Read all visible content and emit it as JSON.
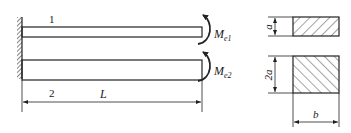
{
  "diagram": {
    "beam1": {
      "label": "1",
      "moment": {
        "symbol": "M",
        "subscript": "e1"
      }
    },
    "beam2": {
      "label": "2",
      "moment": {
        "symbol": "M",
        "subscript": "e2"
      }
    },
    "length_label": "L",
    "section1": {
      "height_label": "a"
    },
    "section2": {
      "height_label": "2a",
      "width_label": "b"
    },
    "colors": {
      "line": "#222222",
      "hatch": "#333333"
    }
  }
}
